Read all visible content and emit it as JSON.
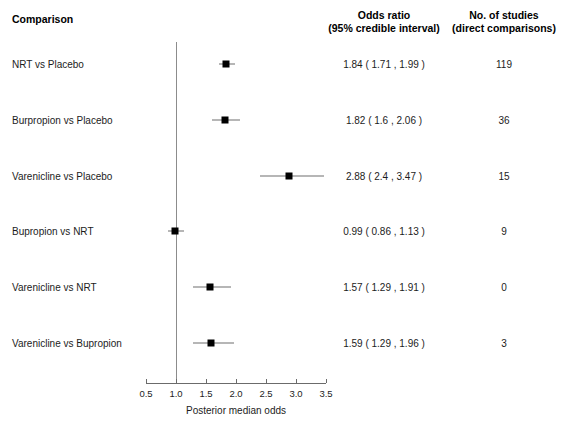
{
  "headers": {
    "comparison": "Comparison",
    "odds_ratio_l1": "Odds ratio",
    "odds_ratio_l2": "(95% credible interval)",
    "studies_l1": "No. of studies",
    "studies_l2": "(direct comparisons)"
  },
  "axis": {
    "xlabel": "Posterior median odds",
    "ticks": [
      "0.5",
      "1.0",
      "1.5",
      "2.0",
      "2.5",
      "3.0",
      "3.5"
    ]
  },
  "rows": [
    {
      "label": "NRT vs Placebo",
      "value_text": "1.84 ( 1.71 , 1.99 )",
      "studies": "119"
    },
    {
      "label": "Burpropion vs Placebo",
      "value_text": "1.82 ( 1.6 , 2.06 )",
      "studies": "36"
    },
    {
      "label": "Varenicline vs Placebo",
      "value_text": "2.88 ( 2.4 , 3.47 )",
      "studies": "15"
    },
    {
      "label": "Bupropion vs NRT",
      "value_text": "0.99 ( 0.86 , 1.13 )",
      "studies": "9"
    },
    {
      "label": "Varenicline vs NRT",
      "value_text": "1.57 ( 1.29 , 1.91 )",
      "studies": "0"
    },
    {
      "label": "Varenicline vs Bupropion",
      "value_text": "1.59 ( 1.29 , 1.96 )",
      "studies": "3"
    }
  ],
  "chart_data": {
    "type": "scatter",
    "subtype": "forest-plot",
    "title": "",
    "xlabel": "Posterior median odds",
    "ylabel": "Comparison",
    "xlim": [
      0.5,
      3.5
    ],
    "xticks": [
      0.5,
      1.0,
      1.5,
      2.0,
      2.5,
      3.0,
      3.5
    ],
    "reference_line_x": 1.0,
    "grid": false,
    "legend": null,
    "categories": [
      "NRT vs Placebo",
      "Burpropion vs Placebo",
      "Varenicline vs Placebo",
      "Bupropion vs NRT",
      "Varenicline vs NRT",
      "Varenicline vs Bupropion"
    ],
    "values": [
      1.84,
      1.82,
      2.88,
      0.99,
      1.57,
      1.59
    ],
    "ci_lower": [
      1.71,
      1.6,
      2.4,
      0.86,
      1.29,
      1.29
    ],
    "ci_upper": [
      1.99,
      2.06,
      3.47,
      1.13,
      1.91,
      1.96
    ],
    "n_studies": [
      119,
      36,
      15,
      9,
      0,
      3
    ],
    "columns": [
      "Comparison",
      "Odds ratio (95% credible interval)",
      "No. of studies (direct comparisons)"
    ]
  },
  "colors": {
    "marker": "#000000",
    "ci_line": "#6e6e6e",
    "reference_line": "#8c8c8c",
    "axis": "#6b6b6b",
    "text": "#1c1c1c",
    "background": "#ffffff"
  }
}
